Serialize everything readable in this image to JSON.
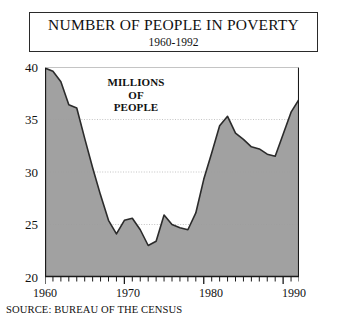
{
  "title": {
    "main": "NUMBER OF PEOPLE IN POVERTY",
    "subtitle": "1960-1992"
  },
  "annotation": {
    "line1": "MILLIONS",
    "line2": "OF",
    "line3": "PEOPLE"
  },
  "source": {
    "text": "SOURCE: BUREAU OF THE CENSUS"
  },
  "axes": {
    "y_ticks": [
      "40",
      "35",
      "30",
      "25",
      "20"
    ],
    "x_ticks": [
      "1960",
      "1970",
      "1980",
      "1990"
    ]
  },
  "colors": {
    "area_fill": "#9c9c9c",
    "line": "#2b2b2b",
    "axis": "#1a1a1a",
    "gridline": "#b5b5b5",
    "background": "#ffffff"
  },
  "chart_data": {
    "type": "area",
    "title": "NUMBER OF PEOPLE IN POVERTY",
    "subtitle": "1960-1992",
    "xlabel": "",
    "ylabel": "MILLIONS OF PEOPLE",
    "xlim": [
      1960,
      1992
    ],
    "ylim": [
      20,
      40
    ],
    "yticks": [
      20,
      25,
      30,
      35,
      40
    ],
    "xticks": [
      1960,
      1970,
      1980,
      1990
    ],
    "grid": true,
    "gridlines_y": [
      25,
      30,
      35
    ],
    "legend": null,
    "annotations": [
      "MILLIONS OF PEOPLE"
    ],
    "source": "SOURCE: BUREAU OF THE CENSUS",
    "units": "millions of people",
    "x": [
      1960,
      1961,
      1962,
      1963,
      1964,
      1965,
      1966,
      1967,
      1968,
      1969,
      1970,
      1971,
      1972,
      1973,
      1974,
      1975,
      1976,
      1977,
      1978,
      1979,
      1980,
      1981,
      1982,
      1983,
      1984,
      1985,
      1986,
      1987,
      1988,
      1989,
      1990,
      1991,
      1992
    ],
    "values": [
      39.9,
      39.6,
      38.6,
      36.4,
      36.1,
      33.2,
      30.4,
      27.8,
      25.4,
      24.1,
      25.4,
      25.6,
      24.5,
      23.0,
      23.4,
      25.9,
      25.0,
      24.7,
      24.5,
      26.1,
      29.3,
      31.8,
      34.4,
      35.3,
      33.7,
      33.1,
      32.4,
      32.2,
      31.7,
      31.5,
      33.6,
      35.7,
      36.9
    ],
    "series": [
      {
        "name": "People in poverty (millions)",
        "values": [
          39.9,
          39.6,
          38.6,
          36.4,
          36.1,
          33.2,
          30.4,
          27.8,
          25.4,
          24.1,
          25.4,
          25.6,
          24.5,
          23.0,
          23.4,
          25.9,
          25.0,
          24.7,
          24.5,
          26.1,
          29.3,
          31.8,
          34.4,
          35.3,
          33.7,
          33.1,
          32.4,
          32.2,
          31.7,
          31.5,
          33.6,
          35.7,
          36.9
        ]
      }
    ]
  }
}
